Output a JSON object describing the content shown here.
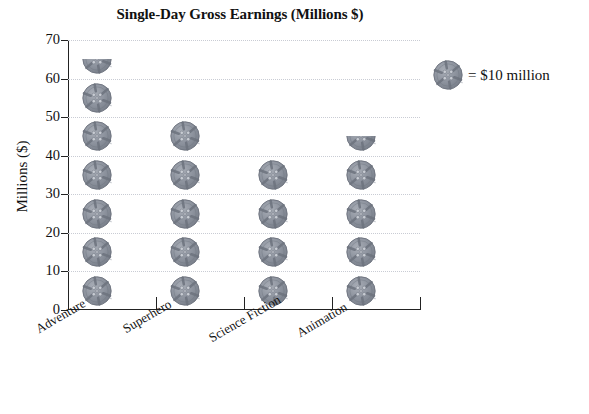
{
  "chart_data": {
    "type": "bar",
    "subtype": "pictograph",
    "title": "Single-Day Gross Earnings (Millions $)",
    "xlabel": "",
    "ylabel": "Millions ($)",
    "categories": [
      "Adventure",
      "Superhero",
      "Science Fiction",
      "Animation"
    ],
    "values": [
      65,
      55,
      45,
      45
    ],
    "icon_value": 10,
    "icons": [
      {
        "category": "Adventure",
        "full": 6,
        "half": 1,
        "total": 65
      },
      {
        "category": "Superhero",
        "full": 5,
        "half": 0,
        "total": 55
      },
      {
        "category": "Science Fiction",
        "full": 4,
        "half": 0,
        "total": 45
      },
      {
        "category": "Animation",
        "full": 4,
        "half": 1,
        "total": 45
      }
    ],
    "ylim": [
      0,
      70
    ],
    "yticks": [
      0,
      10,
      20,
      30,
      40,
      50,
      60,
      70
    ],
    "ytick_labels": [
      "0",
      "10",
      "20",
      "30",
      "40",
      "50",
      "60",
      "70"
    ],
    "grid": true,
    "grid_style": "dotted",
    "legend": {
      "position": "right",
      "icon_name": "film-reel-icon",
      "text": "= $10 million"
    },
    "colors": {
      "icon_fill": "#8b919c",
      "icon_dark": "#6d737e",
      "icon_light": "#c8ccd3",
      "axis": "#222222",
      "grid": "#c9ccd4",
      "text": "#111111",
      "background": "#ffffff"
    }
  },
  "chart": {
    "title": "Single-Day Gross Earnings (Millions $)",
    "y_axis_title": "Millions ($)",
    "y_labels": [
      "70",
      "60",
      "50",
      "40",
      "30",
      "20",
      "10",
      "0"
    ],
    "x_labels": [
      "Adventure",
      "Superhero",
      "Science Fiction",
      "Animation"
    ]
  },
  "legend": {
    "text": "= $10 million"
  }
}
